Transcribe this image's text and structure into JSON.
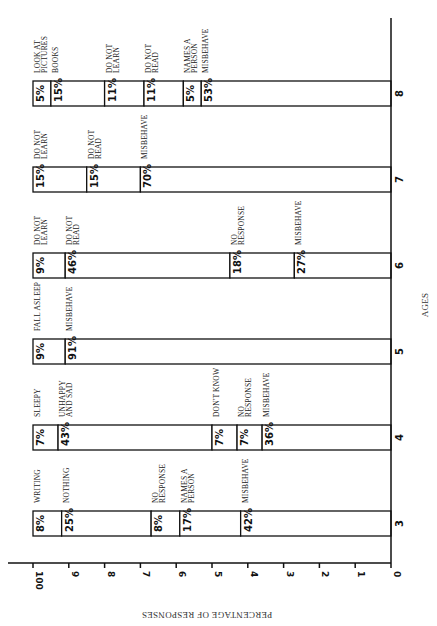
{
  "chart_data": {
    "type": "bar",
    "orientation": "rotated-stacked-horizontal",
    "title": "",
    "xlabel": "AGES",
    "ylabel": "PERCENTAGE OF RESPONSES",
    "ylim": [
      0,
      100
    ],
    "y_ticks": [
      "0",
      "1",
      "2",
      "3",
      "4",
      "5",
      "6",
      "7",
      "8",
      "9",
      "100"
    ],
    "categories": [
      "3",
      "4",
      "5",
      "6",
      "7",
      "8"
    ],
    "bars": [
      {
        "age": "3",
        "segments": [
          {
            "label": "WRITING",
            "value": 8
          },
          {
            "label": "NOTHING",
            "value": 25
          },
          {
            "label": "NO RESPONSE",
            "value": 8
          },
          {
            "label": "NAMES A PERSON",
            "value": 17
          },
          {
            "label": "MISBEHAVE",
            "value": 42
          }
        ]
      },
      {
        "age": "4",
        "segments": [
          {
            "label": "SLEEPY",
            "value": 7
          },
          {
            "label": "UNHAPPY AND SAD",
            "value": 43
          },
          {
            "label": "DON'T KNOW",
            "value": 7
          },
          {
            "label": "NO RESPONSE",
            "value": 7
          },
          {
            "label": "MISBEHAVE",
            "value": 36
          }
        ]
      },
      {
        "age": "5",
        "segments": [
          {
            "label": "FALL ASLEEP",
            "value": 9
          },
          {
            "label": "MISBEHAVE",
            "value": 91
          }
        ]
      },
      {
        "age": "6",
        "segments": [
          {
            "label": "DO NOT LEARN",
            "value": 9
          },
          {
            "label": "DO NOT READ",
            "value": 46
          },
          {
            "label": "NO RESPONSE",
            "value": 18
          },
          {
            "label": "MISBEHAVE",
            "value": 27
          }
        ]
      },
      {
        "age": "7",
        "segments": [
          {
            "label": "DO NOT LEARN",
            "value": 15
          },
          {
            "label": "DO NOT READ",
            "value": 15
          },
          {
            "label": "MISBEHAVE",
            "value": 70
          }
        ]
      },
      {
        "age": "8",
        "segments": [
          {
            "label": "LOOK AT PICTURES",
            "value": 5
          },
          {
            "label": "BOOKS",
            "value": 15
          },
          {
            "label": "DO NOT LEARN",
            "value": 11
          },
          {
            "label": "DO NOT READ",
            "value": 11
          },
          {
            "label": "NAMES A PERSON",
            "value": 5
          },
          {
            "label": "MISBEHAVE",
            "value": 53
          }
        ]
      }
    ],
    "grid": false,
    "legend": "none (segment labels placed beside each segment)"
  },
  "layout": {
    "x100": 33,
    "x0": 391,
    "bar_height": 25,
    "bar_tops": {
      "3": 511,
      "4": 425,
      "5": 339,
      "6": 253,
      "7": 167,
      "8": 81
    }
  }
}
